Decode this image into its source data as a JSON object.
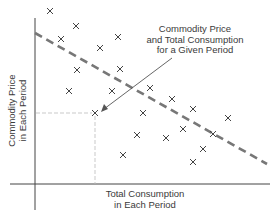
{
  "chart_data": {
    "type": "scatter",
    "title": "",
    "xlabel": "Total Consumption in Each Period",
    "ylabel": "Commodity Price in Each Period",
    "xlabel_lines": [
      "Total Consumption",
      "in Each Period"
    ],
    "ylabel_lines": [
      "Commodity Price",
      "in Each Period"
    ],
    "grid": false,
    "ticks": false,
    "marker": "x",
    "points_px": [
      [
        50,
        11
      ],
      [
        76,
        26
      ],
      [
        61,
        39
      ],
      [
        118,
        37
      ],
      [
        100,
        48
      ],
      [
        77,
        70
      ],
      [
        120,
        69
      ],
      [
        69,
        91
      ],
      [
        112,
        91
      ],
      [
        95,
        113
      ],
      [
        150,
        88
      ],
      [
        172,
        99
      ],
      [
        143,
        113
      ],
      [
        193,
        109
      ],
      [
        228,
        118
      ],
      [
        183,
        129
      ],
      [
        137,
        135
      ],
      [
        166,
        138
      ],
      [
        213,
        134
      ],
      [
        203,
        149
      ],
      [
        123,
        155
      ],
      [
        193,
        162
      ]
    ],
    "trend_line": {
      "style": "dashed",
      "color": "#777777",
      "from_px": [
        35,
        33
      ],
      "to_px": [
        267,
        164
      ],
      "direction": "downward sloping"
    },
    "highlighted_point": {
      "px": [
        95,
        113
      ],
      "guides": "dotted lines to both axes"
    },
    "annotation": {
      "lines": [
        "Commodity Price",
        "and Total Consumption",
        "for a Given Period"
      ],
      "arrow_from_px": [
        172,
        58
      ],
      "arrow_to_px": [
        103,
        110
      ]
    }
  },
  "labels": {
    "annotation_line1": "Commodity Price",
    "annotation_line2": "and Total Consumption",
    "annotation_line3": "for a Given Period",
    "x_line1": "Total Consumption",
    "x_line2": "in Each Period",
    "y_line1": "Commodity Price",
    "y_line2": "in Each Period"
  },
  "colors": {
    "axis": "#444444",
    "marker": "#444444",
    "trend": "#777777",
    "guide": "#bbbbbb"
  }
}
